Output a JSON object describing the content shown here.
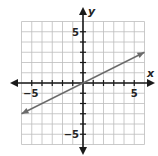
{
  "chart_data": {
    "type": "line",
    "title": "",
    "xlabel": "x",
    "ylabel": "y",
    "xlim": [
      -6,
      6
    ],
    "ylim": [
      -6,
      6
    ],
    "grid": true,
    "x_tick_labels": [
      {
        "value": -5,
        "label": "−5"
      },
      {
        "value": 5,
        "label": "5"
      }
    ],
    "y_tick_labels": [
      {
        "value": 5,
        "label": "5"
      },
      {
        "value": -5,
        "label": "−5"
      }
    ],
    "series": [
      {
        "name": "line",
        "equation": "y = 0.5x",
        "x": [
          -6,
          6
        ],
        "y": [
          -3,
          3
        ],
        "arrows": "both"
      }
    ]
  },
  "colors": {
    "grid": "#bdbdbd",
    "axes": "#1a1a1a",
    "line": "#6b6b6b"
  }
}
